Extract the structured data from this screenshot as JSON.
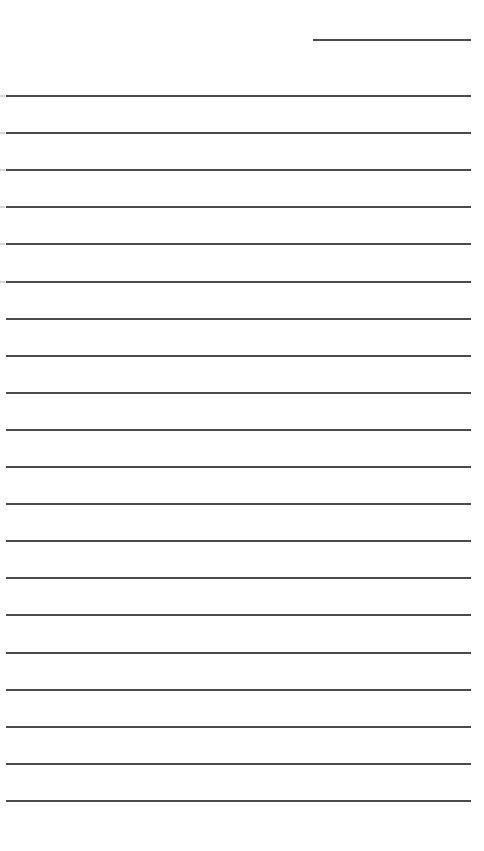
{
  "page": {
    "type": "lined-notepad-sheet",
    "background_color": "#ffffff",
    "line_color": "#4a4a4a",
    "date_line": {
      "label": "",
      "x": 313,
      "y": 39,
      "width": 158
    },
    "lines": {
      "count": 20,
      "start_y": 95,
      "spacing": 37.1,
      "x": 6,
      "width": 465,
      "content": [
        "",
        "",
        "",
        "",
        "",
        "",
        "",
        "",
        "",
        "",
        "",
        "",
        "",
        "",
        "",
        "",
        "",
        "",
        "",
        ""
      ]
    }
  }
}
